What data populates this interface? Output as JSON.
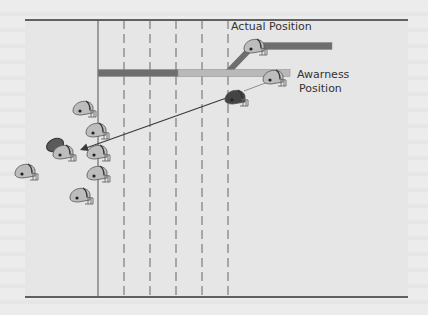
{
  "diagram": {
    "type": "football-play",
    "labels": {
      "actual_position": "Actual Position",
      "awareness_line1": "Awarness",
      "awareness_line2": "Position"
    },
    "colors": {
      "background": "#ececec",
      "field": "#e6e6e6",
      "boundary": "#333333",
      "solid_line": "#555555",
      "dashed_line": "#666666",
      "bar_dark": "#6e6e6e",
      "bar_light": "#b9b9b9",
      "helmet_light": "#bdbdbd",
      "helmet_dark": "#444444",
      "arrow": "#3a3a3a"
    },
    "field": {
      "left": 25,
      "right": 408,
      "top": 20,
      "bottom": 297,
      "solid_line_x": 98,
      "dashed_lines_x": [
        124,
        150,
        176,
        202,
        228
      ]
    },
    "bars": [
      {
        "name": "route-dark",
        "x1": 98,
        "x2": 178,
        "y": 73,
        "h": 7,
        "color": "bar_dark"
      },
      {
        "name": "route-light",
        "x1": 178,
        "x2": 290,
        "y": 73,
        "h": 7,
        "color": "bar_light"
      },
      {
        "name": "route-upper",
        "x1": 258,
        "x2": 332,
        "y": 46,
        "h": 7,
        "color": "bar_dark"
      }
    ],
    "diagonal": {
      "x1": 227,
      "y1": 73,
      "x2": 252,
      "y2": 47
    },
    "helmets": [
      {
        "name": "actual-position-helmet",
        "x": 254,
        "y": 46,
        "dark": false,
        "flip": false
      },
      {
        "name": "awareness-position-helmet",
        "x": 273,
        "y": 77,
        "dark": false,
        "flip": false
      },
      {
        "name": "defender-helmet-dark",
        "x": 235,
        "y": 97,
        "dark": true,
        "flip": false
      },
      {
        "name": "offense-helmet-1",
        "x": 83,
        "y": 108,
        "dark": false,
        "flip": false
      },
      {
        "name": "offense-helmet-2",
        "x": 96,
        "y": 130,
        "dark": false,
        "flip": false
      },
      {
        "name": "offense-helmet-3",
        "x": 97,
        "y": 152,
        "dark": false,
        "flip": false
      },
      {
        "name": "offense-helmet-4",
        "x": 97,
        "y": 173,
        "dark": false,
        "flip": false
      },
      {
        "name": "offense-helmet-5",
        "x": 80,
        "y": 195,
        "dark": false,
        "flip": false
      },
      {
        "name": "offense-helmet-6",
        "x": 25,
        "y": 171,
        "dark": false,
        "flip": false
      },
      {
        "name": "ball-carrier-helmet",
        "x": 63,
        "y": 152,
        "dark": false,
        "flip": false
      }
    ],
    "football": {
      "x": 55,
      "y": 145
    },
    "arrow": {
      "x1": 232,
      "y1": 96,
      "x2": 80,
      "y2": 150
    },
    "guide_line": {
      "x1": 244,
      "y1": 91,
      "x2": 268,
      "y2": 82
    }
  }
}
